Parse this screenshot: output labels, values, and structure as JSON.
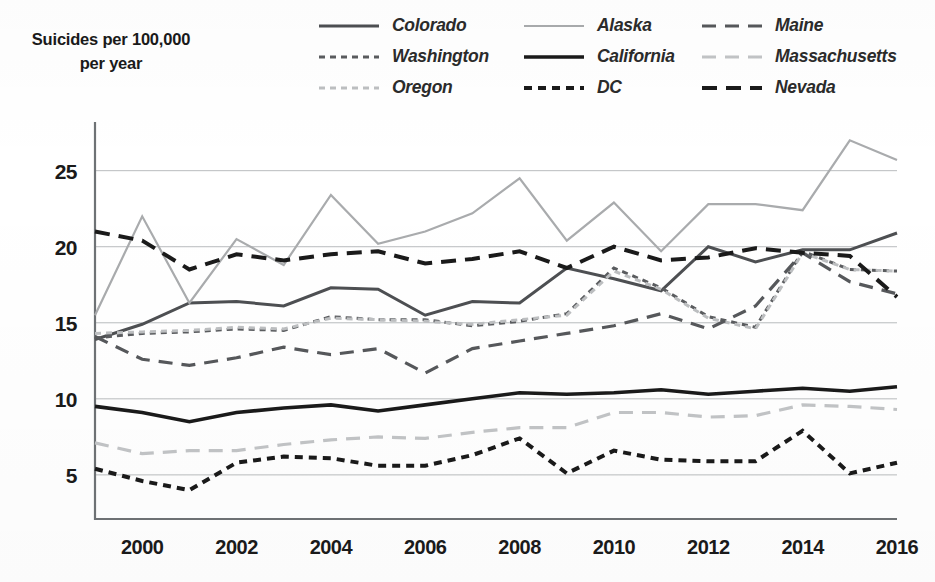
{
  "axis_title": {
    "line1": "Suicides per 100,000",
    "line2": "per year"
  },
  "legend": {
    "items": [
      {
        "label": "Colorado",
        "style": "solid",
        "color": "#4d4f52",
        "width": 3.0,
        "dash": ""
      },
      {
        "label": "Washington",
        "style": "dotted",
        "color": "#5a5c5f",
        "width": 3.0,
        "dash": "6,5"
      },
      {
        "label": "Oregon",
        "style": "dotted",
        "color": "#bdbfc1",
        "width": 3.0,
        "dash": "6,5"
      },
      {
        "label": "Alaska",
        "style": "solid",
        "color": "#a9abad",
        "width": 2.2,
        "dash": ""
      },
      {
        "label": "California",
        "style": "solid",
        "color": "#1a1a1a",
        "width": 3.6,
        "dash": ""
      },
      {
        "label": "DC",
        "style": "dotted",
        "color": "#1a1a1a",
        "width": 4.0,
        "dash": "8,6"
      },
      {
        "label": "Maine",
        "style": "dashed",
        "color": "#56585b",
        "width": 3.2,
        "dash": "14,9"
      },
      {
        "label": "Massachusetts",
        "style": "dashed",
        "color": "#c2c4c6",
        "width": 3.2,
        "dash": "14,9"
      },
      {
        "label": "Nevada",
        "style": "dashed",
        "color": "#1a1a1a",
        "width": 4.0,
        "dash": "15,9"
      }
    ]
  },
  "chart_data": {
    "type": "line",
    "title": "",
    "xlabel": "",
    "ylabel": "Suicides per 100,000 per year",
    "xlim": [
      1999,
      2016
    ],
    "ylim": [
      2.1,
      28.2
    ],
    "grid": true,
    "gridlines_y": [
      5,
      10,
      15,
      20,
      25
    ],
    "y_ticks": [
      5,
      10,
      15,
      20,
      25
    ],
    "y_tick_labels": [
      "5",
      "10",
      "15",
      "20",
      "25"
    ],
    "x_ticks": [
      2000,
      2002,
      2004,
      2006,
      2008,
      2010,
      2012,
      2014,
      2016
    ],
    "x_tick_labels": [
      "2000",
      "2002",
      "2004",
      "2006",
      "2008",
      "2010",
      "2012",
      "2014",
      "2016"
    ],
    "legend_position": "top-right",
    "x": [
      1999,
      2000,
      2001,
      2002,
      2003,
      2004,
      2005,
      2006,
      2007,
      2008,
      2009,
      2010,
      2011,
      2012,
      2013,
      2014,
      2015,
      2016
    ],
    "series": [
      {
        "name": "Colorado",
        "color": "#4d4f52",
        "style": "solid",
        "values": [
          13.9,
          14.9,
          16.3,
          16.4,
          16.1,
          17.3,
          17.2,
          15.5,
          16.4,
          16.3,
          18.6,
          17.9,
          17.1,
          20.0,
          19.0,
          19.8,
          19.8,
          20.9
        ]
      },
      {
        "name": "Washington",
        "color": "#5a5c5f",
        "style": "dotted",
        "values": [
          14.0,
          14.3,
          14.4,
          14.6,
          14.5,
          15.4,
          15.2,
          15.2,
          14.8,
          15.1,
          15.6,
          18.6,
          17.3,
          15.4,
          14.7,
          19.7,
          18.5,
          18.4
        ]
      },
      {
        "name": "Oregon",
        "color": "#bdbfc1",
        "style": "dotted",
        "values": [
          14.3,
          14.4,
          14.5,
          14.7,
          14.6,
          15.3,
          15.2,
          15.1,
          14.9,
          15.2,
          15.5,
          18.4,
          17.2,
          15.3,
          14.6,
          19.6,
          18.5,
          18.4
        ]
      },
      {
        "name": "Alaska",
        "color": "#a9abad",
        "style": "solid",
        "values": [
          15.5,
          22.0,
          16.3,
          20.5,
          18.8,
          23.4,
          20.2,
          21.0,
          22.2,
          24.5,
          20.4,
          22.9,
          19.7,
          22.8,
          22.8,
          22.4,
          27.0,
          25.7
        ]
      },
      {
        "name": "California",
        "color": "#1a1a1a",
        "style": "solid",
        "values": [
          9.5,
          9.1,
          8.5,
          9.1,
          9.4,
          9.6,
          9.2,
          9.6,
          10.0,
          10.4,
          10.3,
          10.4,
          10.6,
          10.3,
          10.5,
          10.7,
          10.5,
          10.8
        ]
      },
      {
        "name": "DC",
        "color": "#1a1a1a",
        "style": "dotted",
        "values": [
          5.4,
          4.6,
          4.0,
          5.8,
          6.2,
          6.1,
          5.6,
          5.6,
          6.3,
          7.4,
          5.1,
          6.6,
          6.0,
          5.9,
          5.9,
          7.9,
          5.1,
          5.8
        ]
      },
      {
        "name": "Maine",
        "color": "#56585b",
        "style": "dashed",
        "values": [
          14.1,
          12.6,
          12.2,
          12.7,
          13.4,
          12.9,
          13.3,
          11.7,
          13.3,
          13.8,
          14.3,
          14.8,
          15.6,
          14.6,
          16.1,
          19.6,
          17.7,
          16.9
        ]
      },
      {
        "name": "Massachusetts",
        "color": "#c2c4c6",
        "style": "dashed",
        "values": [
          7.1,
          6.4,
          6.6,
          6.6,
          7.0,
          7.3,
          7.5,
          7.4,
          7.8,
          8.1,
          8.1,
          9.1,
          9.1,
          8.8,
          8.9,
          9.6,
          9.5,
          9.3
        ]
      },
      {
        "name": "Nevada",
        "color": "#1a1a1a",
        "style": "dashed",
        "values": [
          21.0,
          20.4,
          18.5,
          19.5,
          19.1,
          19.5,
          19.7,
          18.9,
          19.2,
          19.7,
          18.6,
          20.0,
          19.1,
          19.3,
          19.9,
          19.6,
          19.4,
          16.7
        ]
      }
    ]
  }
}
